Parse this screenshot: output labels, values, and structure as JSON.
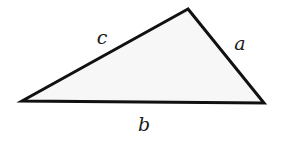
{
  "diagram": {
    "type": "triangle",
    "colors": {
      "stroke": "#111111",
      "fill": "#f7f7f7",
      "label": "#1a1a1a"
    },
    "vertices": {
      "top": [
        188,
        9
      ],
      "left": [
        22,
        101
      ],
      "right": [
        264,
        103
      ]
    },
    "sides": [
      {
        "id": "c",
        "label": "c",
        "between": [
          "left",
          "top"
        ],
        "label_pos": [
          102,
          44
        ]
      },
      {
        "id": "a",
        "label": "a",
        "between": [
          "top",
          "right"
        ],
        "label_pos": [
          240,
          50
        ]
      },
      {
        "id": "b",
        "label": "b",
        "between": [
          "left",
          "right"
        ],
        "label_pos": [
          144,
          131
        ]
      }
    ]
  }
}
